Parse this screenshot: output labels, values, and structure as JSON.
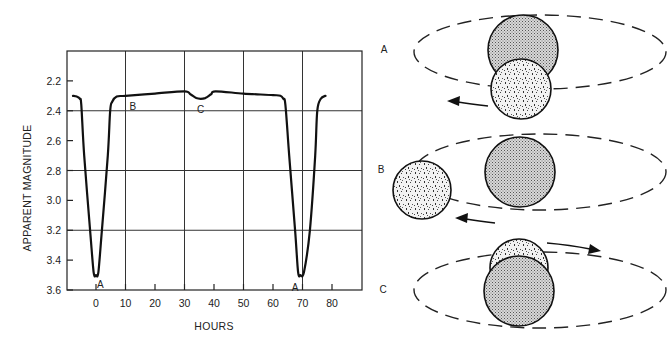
{
  "chart_data": {
    "type": "line",
    "title": "",
    "xlabel": "HOURS",
    "ylabel": "APPARENT MAGNITUDE",
    "xlim": [
      -10,
      90
    ],
    "ylim": [
      2.0,
      3.6
    ],
    "y_inverted": true,
    "grid": true,
    "x_ticks": [
      0,
      10,
      20,
      30,
      40,
      50,
      60,
      70,
      80
    ],
    "x_tick_labels": [
      "0",
      "10",
      "20",
      "30",
      "40",
      "50",
      "60",
      "70",
      "80"
    ],
    "x_gridlines": [
      10,
      30,
      50,
      70
    ],
    "y_ticks": [
      2.2,
      2.4,
      2.6,
      2.8,
      3.0,
      3.2,
      3.4,
      3.6
    ],
    "y_tick_labels": [
      "2.2",
      "2.4",
      "2.6",
      "2.8",
      "3.0",
      "3.2",
      "3.4",
      "3.6"
    ],
    "y_gridlines": [
      2.4,
      2.8,
      3.2
    ],
    "series": [
      {
        "name": "light curve",
        "x": [
          -7.8,
          -6.5,
          -5.5,
          -5.0,
          -4.0,
          -2.0,
          -0.8,
          0,
          0.8,
          2.0,
          4.0,
          4.8,
          5.5,
          7.0,
          10,
          20,
          30,
          32,
          34,
          35.5,
          37,
          39,
          40.5,
          50,
          60,
          62.5,
          63.5,
          64.2,
          65.5,
          67.5,
          68.5,
          69.3,
          70.5,
          72.5,
          74.3,
          75,
          76.2,
          77.8
        ],
        "y": [
          2.3,
          2.305,
          2.32,
          2.36,
          2.7,
          3.2,
          3.48,
          3.5,
          3.48,
          3.2,
          2.7,
          2.4,
          2.34,
          2.305,
          2.3,
          2.285,
          2.27,
          2.29,
          2.315,
          2.32,
          2.315,
          2.29,
          2.27,
          2.285,
          2.295,
          2.3,
          2.32,
          2.36,
          2.7,
          3.2,
          3.48,
          3.5,
          3.48,
          3.2,
          2.7,
          2.4,
          2.32,
          2.3
        ]
      }
    ],
    "annotations": [
      {
        "text": "A",
        "x": 1.5,
        "y": 3.56
      },
      {
        "text": "B",
        "x": 12.5,
        "y": 2.37
      },
      {
        "text": "C",
        "x": 35.5,
        "y": 2.39
      },
      {
        "text": "A",
        "x": 67.5,
        "y": 3.58
      }
    ]
  },
  "diagram": {
    "panels": [
      {
        "label": "A",
        "description": "smaller star in front of larger star (primary eclipse)",
        "arrow_direction": "left"
      },
      {
        "label": "B",
        "description": "stars side by side (no eclipse)",
        "arrow_direction": "left"
      },
      {
        "label": "C",
        "description": "smaller star behind larger star (secondary eclipse)",
        "arrow_direction": "right"
      }
    ]
  },
  "colors": {
    "ink": "#111111",
    "grid": "#333333",
    "background": "#ffffff"
  }
}
